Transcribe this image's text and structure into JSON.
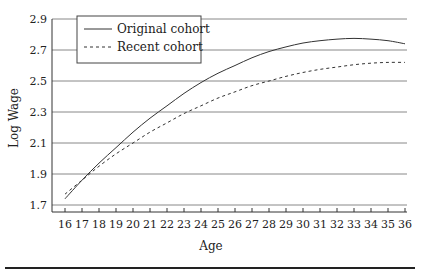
{
  "chart_data": {
    "type": "line",
    "title": "",
    "xlabel": "Age",
    "ylabel": "Log Wage",
    "xlim": [
      16,
      36
    ],
    "ylim": [
      1.7,
      2.9
    ],
    "x_ticks": [
      16,
      17,
      18,
      19,
      20,
      21,
      22,
      23,
      24,
      25,
      26,
      27,
      28,
      29,
      30,
      31,
      32,
      33,
      34,
      35,
      36
    ],
    "y_ticks": [
      1.7,
      1.9,
      2.1,
      2.3,
      2.5,
      2.7,
      2.9
    ],
    "y_tick_labels": [
      "1.7",
      "1.9",
      "2.1",
      "2.3",
      "2.5",
      "2.7",
      "2.9"
    ],
    "grid": "horizontal",
    "legend_position": "upper-left",
    "x": [
      16,
      17,
      18,
      19,
      20,
      21,
      22,
      23,
      24,
      25,
      26,
      27,
      28,
      29,
      30,
      31,
      32,
      33,
      34,
      35,
      36
    ],
    "series": [
      {
        "name": "Original cohort",
        "style": "solid",
        "values": [
          1.74,
          1.86,
          1.97,
          2.07,
          2.17,
          2.26,
          2.34,
          2.42,
          2.49,
          2.55,
          2.6,
          2.65,
          2.69,
          2.72,
          2.745,
          2.76,
          2.77,
          2.775,
          2.77,
          2.76,
          2.74
        ]
      },
      {
        "name": "Recent cohort",
        "style": "dashed",
        "values": [
          1.77,
          1.86,
          1.95,
          2.03,
          2.1,
          2.17,
          2.23,
          2.29,
          2.34,
          2.39,
          2.43,
          2.47,
          2.5,
          2.53,
          2.555,
          2.575,
          2.59,
          2.605,
          2.615,
          2.62,
          2.62
        ]
      }
    ]
  },
  "legend": {
    "items": [
      {
        "label": "Original cohort",
        "style": "solid"
      },
      {
        "label": "Recent cohort",
        "style": "dashed"
      }
    ]
  },
  "axes": {
    "x_title": "Age",
    "y_title": "Log Wage"
  },
  "colors": {
    "line": "#333333",
    "grid": "#888888",
    "axis": "#333333"
  }
}
